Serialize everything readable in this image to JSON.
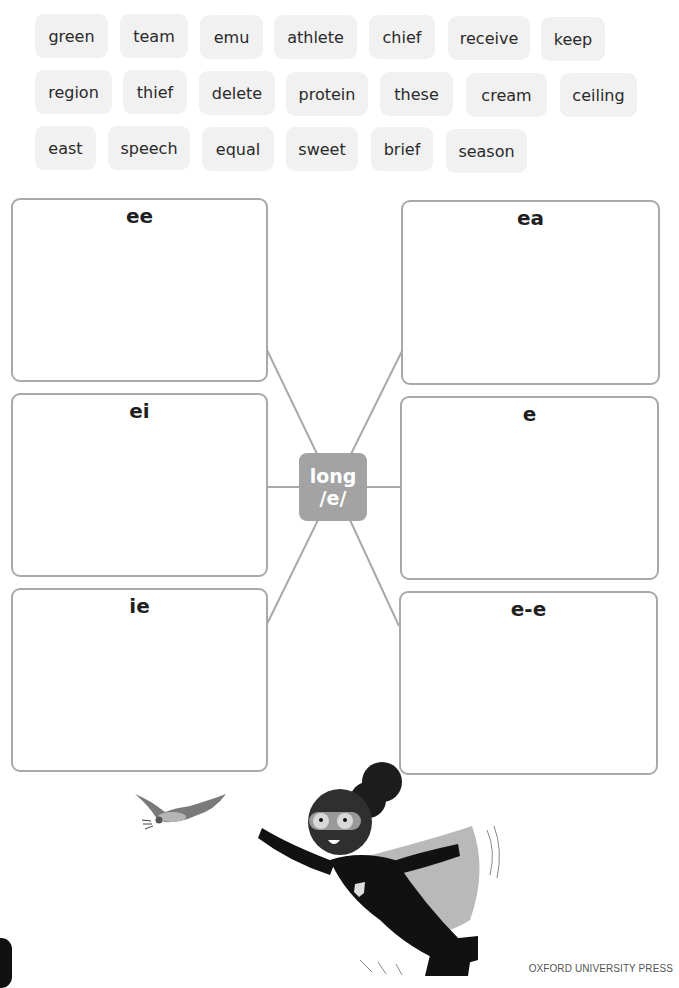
{
  "word_bank": {
    "rows": [
      [
        "green",
        "team",
        "emu",
        "athlete",
        "chief",
        "receive",
        "keep"
      ],
      [
        "region",
        "thief",
        "delete",
        "protein",
        "these",
        "cream",
        "ceiling"
      ],
      [
        "east",
        "speech",
        "equal",
        "sweet",
        "brief",
        "season"
      ]
    ]
  },
  "mind_map": {
    "center": {
      "line1": "long",
      "line2": "/e/"
    },
    "boxes": {
      "ee": {
        "heading": "ee",
        "answer": ""
      },
      "ea": {
        "heading": "ea",
        "answer": ""
      },
      "ei": {
        "heading": "ei",
        "answer": ""
      },
      "e": {
        "heading": "e",
        "answer": ""
      },
      "ie": {
        "heading": "ie",
        "answer": ""
      },
      "e_e": {
        "heading": "e-e",
        "answer": ""
      }
    }
  },
  "illustrations": {
    "bird": "bird-illustration",
    "hero": "flying-superhero-girl-illustration"
  },
  "footer": {
    "publisher": "OXFORD UNIVERSITY PRESS"
  },
  "colors": {
    "chip_bg": "#f1f1f1",
    "box_border": "#a9a9a9",
    "hub_bg": "#a3a3a3",
    "text": "#231f20"
  }
}
